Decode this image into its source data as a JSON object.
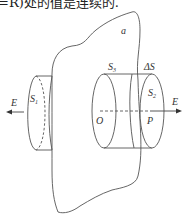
{
  "text_fragment": "=R)处的值是连续的.",
  "figure": {
    "sheet_label": "a",
    "labels": {
      "left_surface": "S",
      "left_surface_sub": "1",
      "side_surface": "S",
      "side_surface_sub": "3",
      "right_surface": "S",
      "right_surface_sub": "2",
      "delta_s": "ΔS",
      "origin": "O",
      "point": "P",
      "field_left": "E",
      "field_right": "E"
    },
    "colors": {
      "stroke": "#555555",
      "text": "#333333"
    }
  }
}
